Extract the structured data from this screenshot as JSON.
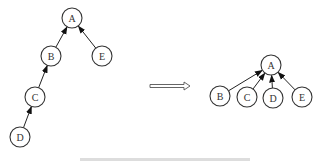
{
  "diagram": {
    "type": "union-find path compression",
    "left_tree": {
      "nodes": [
        {
          "id": "A",
          "label": "A",
          "x": 72,
          "y": 18
        },
        {
          "id": "B",
          "label": "B",
          "x": 51,
          "y": 56
        },
        {
          "id": "E",
          "label": "E",
          "x": 102,
          "y": 56
        },
        {
          "id": "C",
          "label": "C",
          "x": 35,
          "y": 97
        },
        {
          "id": "D",
          "label": "D",
          "x": 20,
          "y": 137
        }
      ],
      "edges": [
        {
          "from": "B",
          "to": "A"
        },
        {
          "from": "E",
          "to": "A"
        },
        {
          "from": "C",
          "to": "B"
        },
        {
          "from": "D",
          "to": "C"
        }
      ]
    },
    "transform_arrow": {
      "x1": 150,
      "x2": 190,
      "y": 86
    },
    "right_tree": {
      "nodes": [
        {
          "id": "A",
          "label": "A",
          "x": 271,
          "y": 65
        },
        {
          "id": "B",
          "label": "B",
          "x": 220,
          "y": 96
        },
        {
          "id": "C",
          "label": "C",
          "x": 247,
          "y": 97
        },
        {
          "id": "D",
          "label": "D",
          "x": 273,
          "y": 98
        },
        {
          "id": "E",
          "label": "E",
          "x": 302,
          "y": 97
        }
      ],
      "edges": [
        {
          "from": "B",
          "to": "A"
        },
        {
          "from": "C",
          "to": "A"
        },
        {
          "from": "D",
          "to": "A"
        },
        {
          "from": "E",
          "to": "A"
        }
      ]
    },
    "node_radius": 10,
    "colors": {
      "stroke": "#333333",
      "background": "#ffffff"
    }
  }
}
